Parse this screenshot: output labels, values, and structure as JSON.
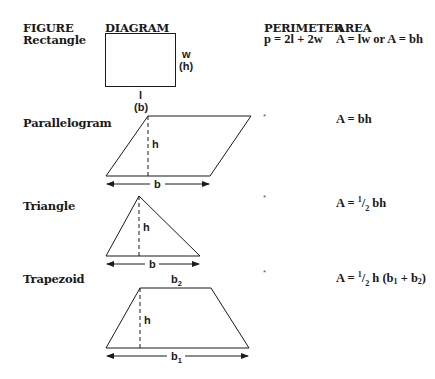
{
  "headers": {
    "figure": "FIGURE",
    "diagram": "DIAGRAM",
    "perimeter": "PERIMETER",
    "area": "AREA"
  },
  "rows": [
    {
      "figure": "Rectangle",
      "perimeter": "p = 2l + 2w",
      "area": "A = lw or A = bh",
      "labels": {
        "side": "w",
        "side_alt": "(h)",
        "bottom": "l",
        "bottom_alt": "(b)"
      }
    },
    {
      "figure": "Parallelogram",
      "perimeter": "*",
      "area": "A = bh",
      "labels": {
        "height": "h",
        "base": "b"
      }
    },
    {
      "figure": "Triangle",
      "perimeter": "*",
      "area_prefix": "A = ",
      "area_frac_num": "1",
      "area_frac_den": "2",
      "area_suffix": " bh",
      "labels": {
        "height": "h",
        "base": "b"
      }
    },
    {
      "figure": "Trapezoid",
      "perimeter": "*",
      "area_prefix": "A = ",
      "area_frac_num": "1",
      "area_frac_den": "2",
      "area_mid": " h (b",
      "area_sub1": "1",
      "area_plus": " + b",
      "area_sub2": "2",
      "area_close": ")",
      "labels": {
        "height": "h",
        "top_base": "b",
        "top_base_sub": "2",
        "bottom_base": "b",
        "bottom_base_sub": "1"
      }
    }
  ]
}
